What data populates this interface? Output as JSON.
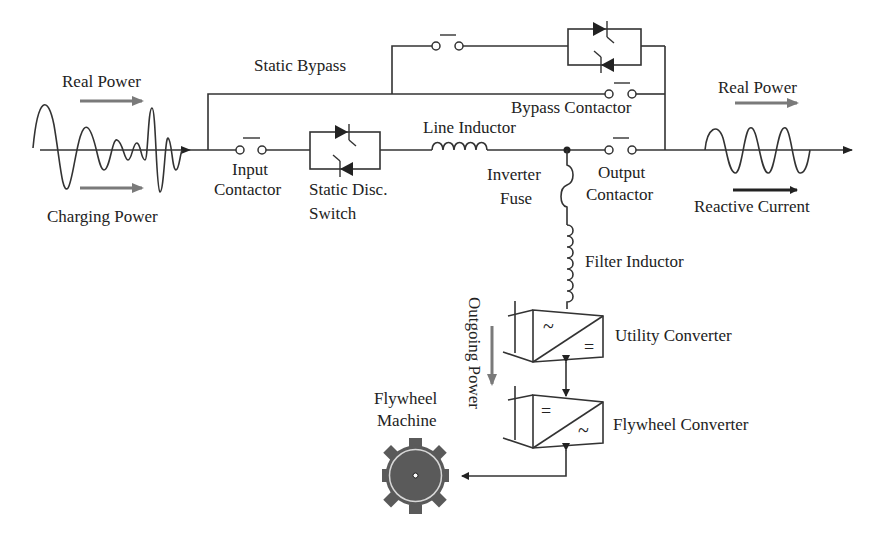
{
  "diagram": {
    "title_hint": "Flywheel UPS system single-line diagram",
    "labels": {
      "real_power_in": "Real Power",
      "charging_power": "Charging Power",
      "static_bypass": "Static Bypass",
      "bypass_contactor": "Bypass Contactor",
      "input_line1": "Input",
      "input_line2": "Contactor",
      "static_disc_line1": "Static Disc.",
      "static_disc_line2": "Switch",
      "line_inductor": "Line Inductor",
      "inverter_fuse_line1": "Inverter",
      "inverter_fuse_line2": "Fuse",
      "output_line1": "Output",
      "output_line2": "Contactor",
      "real_power_out": "Real Power",
      "reactive_current": "Reactive Current",
      "filter_inductor": "Filter Inductor",
      "utility_converter": "Utility Converter",
      "flywheel_converter": "Flywheel Converter",
      "outgoing_power": "Outgoing Power",
      "flywheel_machine_line1": "Flywheel",
      "flywheel_machine_line2": "Machine"
    },
    "symbols": {
      "utility_converter_top": "~",
      "utility_converter_bottom": "=",
      "flywheel_converter_top": "=",
      "flywheel_converter_bottom": "~"
    },
    "colors": {
      "line": "#333333",
      "power_arrow": "#7a7a7a",
      "flywheel_fill": "#5a5a5a",
      "background": "#ffffff"
    }
  }
}
